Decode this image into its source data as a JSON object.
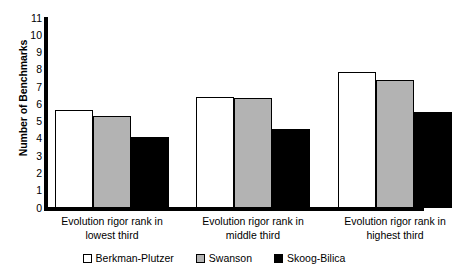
{
  "chart_data": {
    "type": "bar",
    "title": "",
    "xlabel": "",
    "ylabel": "Number of Benchmarks",
    "ylim": [
      0,
      11
    ],
    "grid": false,
    "legend_position": "bottom",
    "categories": [
      "Evolution rigor rank in lowest third",
      "Evolution rigor rank in middle third",
      "Evolution rigor rank in highest third"
    ],
    "category_lines": [
      [
        "Evolution rigor rank in",
        "lowest third"
      ],
      [
        "Evolution rigor rank in",
        "middle third"
      ],
      [
        "Evolution rigor rank in",
        "highest third"
      ]
    ],
    "ytick_labels": [
      "11",
      "10",
      "9",
      "8",
      "7",
      "6",
      "5",
      "4",
      "3",
      "2",
      "1",
      "0"
    ],
    "yticks": [
      11,
      10,
      9,
      8,
      7,
      6,
      5,
      4,
      3,
      2,
      1,
      0
    ],
    "series": [
      {
        "name": "Berkman-Plutzer",
        "color": "#ffffff",
        "values": [
          5.65,
          6.45,
          7.85
        ]
      },
      {
        "name": "Swanson",
        "color": "#b3b3b3",
        "values": [
          5.3,
          6.35,
          7.4
        ]
      },
      {
        "name": "Skoog-Bilica",
        "color": "#000000",
        "values": [
          4.1,
          4.6,
          5.55
        ]
      }
    ]
  },
  "legend": {
    "items": [
      {
        "label": "Berkman-Plutzer"
      },
      {
        "label": "Swanson"
      },
      {
        "label": "Skoog-Bilica"
      }
    ]
  },
  "axes": {
    "y_title": "Number of Benchmarks",
    "axis_color": "#000000"
  }
}
